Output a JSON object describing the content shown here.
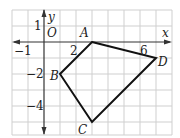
{
  "figure": {
    "type": "coordinate-grid-quadrilateral",
    "grid": {
      "x_min": -2,
      "x_max": 8,
      "y_min": -5.8,
      "y_max": 2,
      "unit_px": 16,
      "origin_px": [
        44,
        42
      ],
      "grid_color": "#cfcfcf",
      "line_color": "#111111"
    },
    "axes": {
      "x_label": "x",
      "y_label": "y",
      "origin_label": "O"
    },
    "tick_labels": [
      {
        "id": "xm1",
        "text": "−1",
        "axis": "x",
        "value": -1
      },
      {
        "id": "x2",
        "text": "2",
        "axis": "x",
        "value": 2
      },
      {
        "id": "x6",
        "text": "6",
        "axis": "x",
        "value": 6
      },
      {
        "id": "y1",
        "text": "1",
        "axis": "y",
        "value": 1
      },
      {
        "id": "ym2",
        "text": "−2",
        "axis": "y",
        "value": -2
      },
      {
        "id": "ym4",
        "text": "−4",
        "axis": "y",
        "value": -4
      }
    ],
    "vertices": [
      {
        "name": "A",
        "x": 3,
        "y": 0
      },
      {
        "name": "D",
        "x": 7,
        "y": -1
      },
      {
        "name": "C",
        "x": 3,
        "y": -5
      },
      {
        "name": "B",
        "x": 1,
        "y": -2
      }
    ]
  }
}
